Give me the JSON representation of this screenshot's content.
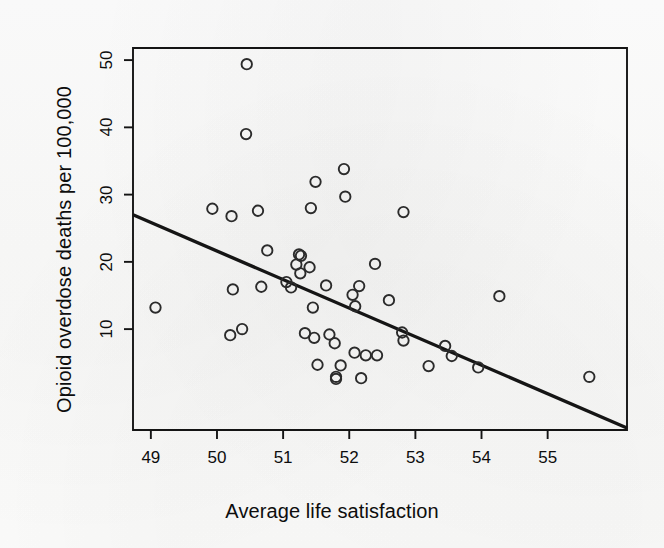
{
  "figure": {
    "background_color": "#fdfdfc",
    "ink_color": "#141414",
    "point_stroke_color": "#2b2b2b",
    "line_color": "#151515"
  },
  "axes": {
    "x_title": "Average life satisfaction",
    "y_title": "Opioid overdose deaths per 100,000",
    "x_ticks": [
      "49",
      "50",
      "51",
      "52",
      "53",
      "54",
      "55"
    ],
    "y_ticks": [
      "10",
      "20",
      "30",
      "40",
      "50"
    ]
  },
  "chart_data": {
    "type": "scatter",
    "title": "",
    "xlabel": "Average life satisfaction",
    "ylabel": "Opioid overdose deaths per 100,000",
    "xlim": [
      48.73,
      56.2
    ],
    "ylim": [
      -5.0,
      51.8
    ],
    "xticks": [
      49,
      50,
      51,
      52,
      53,
      54,
      55
    ],
    "yticks": [
      10,
      20,
      30,
      40,
      50
    ],
    "grid": false,
    "legend": null,
    "marker": "open-circle",
    "points": [
      {
        "x": 49.07,
        "y": 13.2
      },
      {
        "x": 49.93,
        "y": 27.9
      },
      {
        "x": 50.22,
        "y": 26.8
      },
      {
        "x": 50.2,
        "y": 9.1
      },
      {
        "x": 50.24,
        "y": 15.9
      },
      {
        "x": 50.38,
        "y": 10.0
      },
      {
        "x": 50.45,
        "y": 49.4
      },
      {
        "x": 50.44,
        "y": 39.0
      },
      {
        "x": 50.62,
        "y": 27.6
      },
      {
        "x": 50.67,
        "y": 16.3
      },
      {
        "x": 50.76,
        "y": 21.7
      },
      {
        "x": 51.05,
        "y": 17.0
      },
      {
        "x": 51.12,
        "y": 16.2
      },
      {
        "x": 51.2,
        "y": 19.6
      },
      {
        "x": 51.24,
        "y": 21.1
      },
      {
        "x": 51.26,
        "y": 18.3
      },
      {
        "x": 51.27,
        "y": 20.9
      },
      {
        "x": 51.33,
        "y": 9.4
      },
      {
        "x": 51.42,
        "y": 28.0
      },
      {
        "x": 51.4,
        "y": 19.2
      },
      {
        "x": 51.45,
        "y": 13.2
      },
      {
        "x": 51.47,
        "y": 8.7
      },
      {
        "x": 51.49,
        "y": 31.9
      },
      {
        "x": 51.52,
        "y": 4.7
      },
      {
        "x": 51.65,
        "y": 16.5
      },
      {
        "x": 51.7,
        "y": 9.2
      },
      {
        "x": 51.78,
        "y": 7.9
      },
      {
        "x": 51.8,
        "y": 2.9
      },
      {
        "x": 51.8,
        "y": 2.6
      },
      {
        "x": 51.87,
        "y": 4.6
      },
      {
        "x": 51.92,
        "y": 33.8
      },
      {
        "x": 51.94,
        "y": 29.7
      },
      {
        "x": 52.05,
        "y": 15.1
      },
      {
        "x": 52.08,
        "y": 6.5
      },
      {
        "x": 52.09,
        "y": 13.4
      },
      {
        "x": 52.15,
        "y": 16.4
      },
      {
        "x": 52.18,
        "y": 2.7
      },
      {
        "x": 52.25,
        "y": 6.1
      },
      {
        "x": 52.39,
        "y": 19.7
      },
      {
        "x": 52.42,
        "y": 6.1
      },
      {
        "x": 52.6,
        "y": 14.3
      },
      {
        "x": 52.82,
        "y": 27.4
      },
      {
        "x": 52.8,
        "y": 9.5
      },
      {
        "x": 52.82,
        "y": 8.3
      },
      {
        "x": 53.2,
        "y": 4.5
      },
      {
        "x": 53.45,
        "y": 7.5
      },
      {
        "x": 53.55,
        "y": 6.0
      },
      {
        "x": 53.95,
        "y": 4.3
      },
      {
        "x": 54.27,
        "y": 14.9
      },
      {
        "x": 55.63,
        "y": 2.9
      }
    ],
    "fit_line": {
      "type": "linear",
      "x_start": 48.73,
      "y_start": 27.0,
      "x_end": 56.2,
      "y_end": -4.7,
      "description": "negative-slope regression line"
    }
  }
}
